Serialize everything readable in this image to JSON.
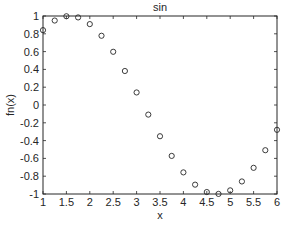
{
  "chart_data": {
    "type": "scatter",
    "title": "sin",
    "xlabel": "x",
    "ylabel": "fn(x)",
    "xlim": [
      1,
      6
    ],
    "ylim": [
      -1,
      1
    ],
    "grid": false,
    "legend": null,
    "marker": "circle-open",
    "x_ticks": [
      1,
      1.5,
      2,
      2.5,
      3,
      3.5,
      4,
      4.5,
      5,
      5.5,
      6
    ],
    "x_tick_labels": [
      "1",
      "1.5",
      "2",
      "2.5",
      "3",
      "3.5",
      "4",
      "4.5",
      "5",
      "5.5",
      "6"
    ],
    "y_ticks": [
      -1,
      -0.8,
      -0.6,
      -0.4,
      -0.2,
      0,
      0.2,
      0.4,
      0.6,
      0.8,
      1
    ],
    "y_tick_labels": [
      "-1",
      "-0.8",
      "-0.6",
      "-0.4",
      "-0.2",
      "0",
      "0.2",
      "0.4",
      "0.6",
      "0.8",
      "1"
    ],
    "series": [
      {
        "name": "sin",
        "x": [
          1,
          1.25,
          1.5,
          1.75,
          2,
          2.25,
          2.5,
          2.75,
          3,
          3.25,
          3.5,
          3.75,
          4,
          4.25,
          4.5,
          4.75,
          5,
          5.25,
          5.5,
          5.75,
          6
        ],
        "y": [
          0.841,
          0.949,
          0.997,
          0.984,
          0.909,
          0.778,
          0.598,
          0.382,
          0.141,
          -0.108,
          -0.351,
          -0.572,
          -0.757,
          -0.895,
          -0.978,
          -0.999,
          -0.959,
          -0.859,
          -0.706,
          -0.508,
          -0.279
        ]
      }
    ]
  },
  "colors": {
    "axis": "#262626",
    "marker": "#262626",
    "background": "#ffffff"
  }
}
